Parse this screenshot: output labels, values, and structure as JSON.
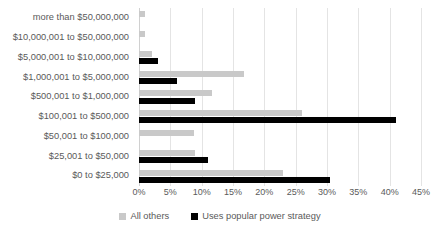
{
  "chart_data": {
    "type": "bar",
    "orientation": "horizontal",
    "title": "",
    "subtitle": "",
    "xlabel": "",
    "ylabel": "",
    "xlim": [
      0,
      45
    ],
    "xunit": "%",
    "grid": true,
    "legend_position": "bottom",
    "categories": [
      "more than $50,000,000",
      "$10,000,001 to $50,000,000",
      "$5,000,001 to $10,000,000",
      "$1,000,001 to $5,000,000",
      "$500,001 to $1,000,000",
      "$100,001 to $500,000",
      "$50,001 to $100,000",
      "$25,001 to $50,000",
      "$0 to $25,000"
    ],
    "xticks": [
      {
        "value": 0,
        "label": "0%"
      },
      {
        "value": 5,
        "label": "5%"
      },
      {
        "value": 10,
        "label": "10%"
      },
      {
        "value": 15,
        "label": "15%"
      },
      {
        "value": 20,
        "label": "20%"
      },
      {
        "value": 25,
        "label": "25%"
      },
      {
        "value": 30,
        "label": "30%"
      },
      {
        "value": 35,
        "label": "35%"
      },
      {
        "value": 40,
        "label": "40%"
      },
      {
        "value": 45,
        "label": "45%"
      }
    ],
    "series": [
      {
        "name": "All others",
        "color": "#c9c9c9",
        "values": [
          1.0,
          1.0,
          2.0,
          16.8,
          11.7,
          26.0,
          8.8,
          9.0,
          23.0
        ]
      },
      {
        "name": "Uses popular power strategy",
        "color": "#000000",
        "values": [
          0,
          0,
          3.0,
          6.0,
          9.0,
          41.0,
          0,
          11.0,
          30.5
        ]
      }
    ]
  }
}
